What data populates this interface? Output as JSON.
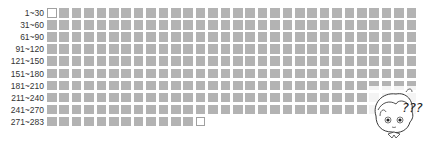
{
  "grid": {
    "columns": 30,
    "total": 283,
    "fill_color": "#b3b3b3",
    "empty_border_color": "#a0a0a0",
    "rows": [
      {
        "label": "1~30",
        "count": 30,
        "empty": [
          0
        ]
      },
      {
        "label": "31~60",
        "count": 30,
        "empty": []
      },
      {
        "label": "61~90",
        "count": 30,
        "empty": []
      },
      {
        "label": "91~120",
        "count": 30,
        "empty": []
      },
      {
        "label": "121~150",
        "count": 30,
        "empty": []
      },
      {
        "label": "151~180",
        "count": 30,
        "empty": []
      },
      {
        "label": "181~210",
        "count": 30,
        "empty": []
      },
      {
        "label": "211~240",
        "count": 30,
        "empty": []
      },
      {
        "label": "241~270",
        "count": 30,
        "empty": []
      },
      {
        "label": "271~283",
        "count": 13,
        "empty": [
          12
        ]
      }
    ]
  },
  "mascot": {
    "icon": "confused-character-icon",
    "text": "???"
  }
}
